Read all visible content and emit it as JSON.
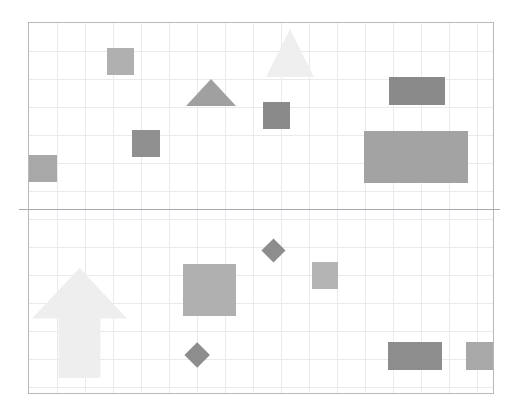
{
  "canvas": {
    "width": 515,
    "height": 418,
    "background": "#ffffff"
  },
  "plot": {
    "left": 28,
    "top": 22,
    "width": 466,
    "height": 372,
    "border_color": "#b9b9b9",
    "grid_color": "#e9e9ee",
    "grid_spacing": 28,
    "grid_on": true
  },
  "divider": {
    "name": "horizontal-divider-line",
    "left": 19,
    "top": 209,
    "width": 481,
    "color": "#a9a9b2",
    "thickness": 1
  },
  "chart_data": {
    "type": "scatter",
    "title": "",
    "subtitle": "",
    "xlabel": "",
    "ylabel": "",
    "xlim": [
      0,
      466
    ],
    "ylim": [
      0,
      372
    ],
    "grid": true,
    "legend": "none",
    "units": "pixels",
    "bands": [
      {
        "name": "upper-band",
        "y_range": [
          22,
          209
        ],
        "shape_count": 8
      },
      {
        "name": "lower-band",
        "y_range": [
          209,
          394
        ],
        "shape_count": 7
      }
    ],
    "shapes": [
      {
        "id": "sq-left-upper",
        "name": "square-left-upper",
        "band": "upper",
        "type": "rect",
        "x": 28,
        "y": 154,
        "w": 28,
        "h": 27,
        "color": "#a8a8a8"
      },
      {
        "id": "sq-top-left",
        "name": "square-top-left",
        "band": "upper",
        "type": "rect",
        "x": 106,
        "y": 47,
        "w": 27,
        "h": 27,
        "color": "#b0b0b0"
      },
      {
        "id": "sq-mid-left",
        "name": "square-mid-left",
        "band": "upper",
        "type": "rect",
        "x": 131,
        "y": 129,
        "w": 28,
        "h": 27,
        "color": "#909090"
      },
      {
        "id": "tri-small",
        "name": "triangle-small-center",
        "band": "upper",
        "type": "triangle",
        "x": 185,
        "y": 78,
        "w": 51,
        "h": 27,
        "color": "#a0a0a0"
      },
      {
        "id": "tri-large-light",
        "name": "triangle-large-light",
        "band": "upper",
        "type": "triangle",
        "x": 265,
        "y": 28,
        "w": 48,
        "h": 48,
        "color": "#efefef"
      },
      {
        "id": "sq-dark-center",
        "name": "square-dark-center",
        "band": "upper",
        "type": "rect",
        "x": 262,
        "y": 101,
        "w": 27,
        "h": 27,
        "color": "#8a8a8a"
      },
      {
        "id": "rect-dark-right",
        "name": "rectangle-dark-upper-right",
        "band": "upper",
        "type": "rect",
        "x": 388,
        "y": 76,
        "w": 56,
        "h": 28,
        "color": "#8a8a8a"
      },
      {
        "id": "rect-large-right",
        "name": "rectangle-large-upper-right",
        "band": "upper",
        "type": "rect",
        "x": 363,
        "y": 130,
        "w": 104,
        "h": 52,
        "color": "#a3a3a3"
      },
      {
        "id": "arrow-up",
        "name": "arrow-up-lower-left",
        "band": "lower",
        "type": "arrow-up",
        "x": 31,
        "y": 267,
        "w": 95,
        "h": 110,
        "color": "#eeeeee"
      },
      {
        "id": "sq-center-lower",
        "name": "square-center-lower",
        "band": "lower",
        "type": "rect",
        "x": 182,
        "y": 263,
        "w": 53,
        "h": 52,
        "color": "#b0b0b0"
      },
      {
        "id": "diamond-upper",
        "name": "diamond-upper-lower-band",
        "band": "lower",
        "type": "diamond",
        "cx": 272,
        "cy": 249,
        "size": 24,
        "color": "#8d8d8d"
      },
      {
        "id": "diamond-lower",
        "name": "diamond-lower-lower-band",
        "band": "lower",
        "type": "diamond",
        "cx": 196,
        "cy": 354,
        "size": 26,
        "color": "#8d8d8d"
      },
      {
        "id": "sq-small-lower",
        "name": "square-small-lower-center",
        "band": "lower",
        "type": "rect",
        "x": 311,
        "y": 261,
        "w": 26,
        "h": 27,
        "color": "#b4b4b4"
      },
      {
        "id": "rect-bottom-right",
        "name": "rectangle-bottom-right",
        "band": "lower",
        "type": "rect",
        "x": 387,
        "y": 341,
        "w": 54,
        "h": 28,
        "color": "#8d8d8d"
      },
      {
        "id": "rect-bottom-far-right",
        "name": "rectangle-bottom-far-right",
        "band": "lower",
        "type": "rect",
        "x": 465,
        "y": 341,
        "w": 29,
        "h": 28,
        "color": "#a8a8a8"
      }
    ]
  }
}
